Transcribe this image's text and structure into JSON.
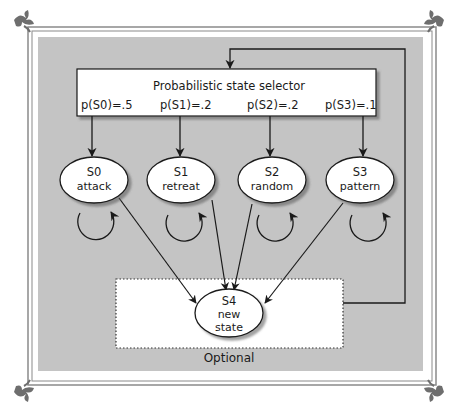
{
  "selector": {
    "title": "Probabilistic state selector",
    "probabilities": [
      "p(S0)=.5",
      "p(S1)=.2",
      "p(S2)=.2",
      "p(S3)=.1"
    ]
  },
  "states": [
    {
      "id": "S0",
      "name": "attack"
    },
    {
      "id": "S1",
      "name": "retreat"
    },
    {
      "id": "S2",
      "name": "random"
    },
    {
      "id": "S3",
      "name": "pattern"
    }
  ],
  "new_state": {
    "id": "S4",
    "line1": "new",
    "line2": "state"
  },
  "optional_label": "Optional",
  "colors": {
    "panel": "#c4c4c4",
    "frame": "#7a7a7a",
    "box": "#ffffff",
    "stroke": "#1a1a1a"
  }
}
